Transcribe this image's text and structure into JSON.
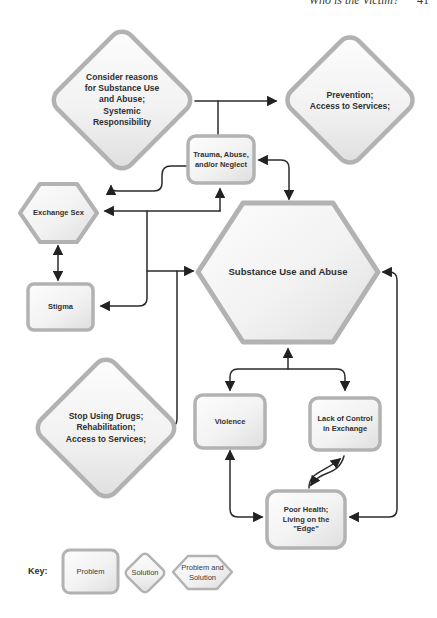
{
  "page": {
    "header": "Who is the Victim?",
    "page_number": "41"
  },
  "colors": {
    "shape_border": "#b2b2b2",
    "shape_fill_light": "#fcfcfc",
    "shape_fill_dark": "#e0e0e0",
    "connector": "#2b2b2b",
    "text": "#303030"
  },
  "nodes": {
    "consider": {
      "shape": "diamond",
      "meaning": "Solution",
      "text": "Consider reasons\nfor Substance Use\nand Abuse;\nSystemic\nResponsibility"
    },
    "prevention": {
      "shape": "diamond",
      "meaning": "Solution",
      "text": "Prevention;\nAccess to Services;"
    },
    "trauma": {
      "shape": "rounded-rectangle",
      "meaning": "Problem",
      "text": "Trauma, Abuse,\nand/or Neglect"
    },
    "exchange_sex": {
      "shape": "hexagon",
      "meaning": "Problem and Solution",
      "text": "Exchange Sex"
    },
    "substance": {
      "shape": "hexagon",
      "meaning": "Problem and Solution",
      "text": "Substance Use and Abuse"
    },
    "stigma": {
      "shape": "rounded-rectangle",
      "meaning": "Problem",
      "text": "Stigma"
    },
    "stop_drugs": {
      "shape": "diamond",
      "meaning": "Solution",
      "text": "Stop Using Drugs;\nRehabilitation;\nAccess to Services;"
    },
    "violence": {
      "shape": "rounded-rectangle",
      "meaning": "Problem",
      "text": "Violence"
    },
    "lack_control": {
      "shape": "rounded-rectangle",
      "meaning": "Problem",
      "text": "Lack of Control\nin Exchange"
    },
    "poor_health": {
      "shape": "rounded-rectangle",
      "meaning": "Problem",
      "text": "Poor Health;\nLiving on the\n\"Edge\""
    }
  },
  "key": {
    "label": "Key:",
    "items": [
      {
        "shape": "rounded-rectangle",
        "label": "Problem"
      },
      {
        "shape": "diamond",
        "label": "Solution"
      },
      {
        "shape": "hexagon",
        "label": "Problem and\nSolution"
      }
    ]
  }
}
